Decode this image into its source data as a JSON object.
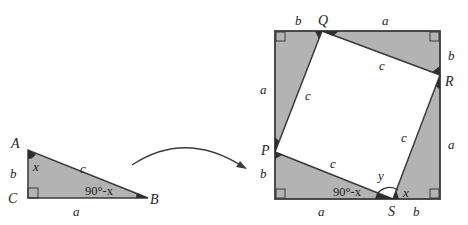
{
  "diagram": {
    "type": "pythagorean-proof",
    "colors": {
      "fill": "#b3b3b3",
      "stroke": "#3a3a3a",
      "angle_mark": "#2e2e2e",
      "background": "#ffffff"
    },
    "small_triangle": {
      "vertices": {
        "A": "A",
        "B": "B",
        "C": "C"
      },
      "sides": {
        "AC": "b",
        "AB": "c",
        "CB": "a"
      },
      "angles": {
        "A": "x",
        "B": "90°-x",
        "C": "right-angle"
      }
    },
    "arrow": {
      "from": "small_triangle",
      "to": "square"
    },
    "square": {
      "points": {
        "P": "P",
        "Q": "Q",
        "R": "R",
        "S": "S"
      },
      "top_labels": [
        "b",
        "a"
      ],
      "right_labels": [
        "b",
        "a"
      ],
      "bottom_labels": [
        "a",
        "b"
      ],
      "left_labels": [
        "a",
        "b"
      ],
      "inner_sides": [
        "c",
        "c",
        "c",
        "c"
      ],
      "angle_labels": {
        "bottom_left_triangle": "90°-x",
        "at_S_middle": "y",
        "bottom_right_triangle": "x"
      }
    }
  }
}
